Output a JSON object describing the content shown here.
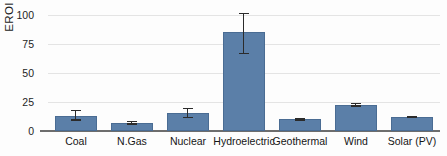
{
  "chart_data": {
    "type": "bar",
    "title": "",
    "xlabel": "",
    "ylabel": "EROI",
    "ylim": [
      0,
      100
    ],
    "yticks": [
      0,
      25,
      50,
      75,
      100
    ],
    "grid": true,
    "legend": false,
    "categories": [
      "Coal",
      "N.Gas",
      "Nuclear",
      "Hydroelectric",
      "Geothermal",
      "Wind",
      "Solar (PV)"
    ],
    "values": [
      13,
      7,
      15.5,
      85,
      10,
      22.5,
      12
    ],
    "error_low": [
      9,
      5.5,
      11,
      66,
      9,
      21,
      11
    ],
    "error_high": [
      18,
      9,
      20,
      102,
      11,
      24,
      13
    ],
    "bar_color": "#5b7fa8",
    "gridline_color": "#e4e4e4",
    "axis_color": "#6d6d6d",
    "errorbar_color": "#2b2b2b"
  },
  "axis": {
    "y_title": "EROI",
    "tick_labels": [
      "100",
      "75",
      "50",
      "25",
      "0"
    ]
  }
}
